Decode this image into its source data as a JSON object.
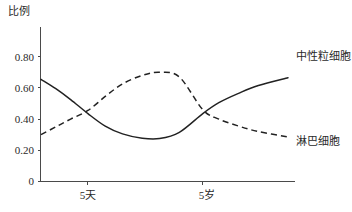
{
  "chart_data": {
    "type": "line",
    "title": "",
    "subtitle": "",
    "xlabel": "",
    "ylabel": "比例",
    "ylim": [
      0,
      0.99
    ],
    "ytick_labels": [
      "0.80",
      "0.60",
      "0.40",
      "0.20",
      "0"
    ],
    "ytick_values": [
      0.8,
      0.6,
      0.4,
      0.2,
      0
    ],
    "xtick_labels": [
      "5天",
      "5岁"
    ],
    "xtick_values": [
      0.19,
      0.655
    ],
    "xlim": [
      0,
      1
    ],
    "grid": false,
    "legend_position": "inline-right",
    "series": [
      {
        "name": "中性粒细胞",
        "style": "solid",
        "label_x": 0.99,
        "label_y": 0.675,
        "x": [
          0.0,
          0.06,
          0.12,
          0.19,
          0.26,
          0.33,
          0.41,
          0.48,
          0.56,
          0.655,
          0.72,
          0.8,
          0.88,
          1.0
        ],
        "values": [
          0.655,
          0.595,
          0.525,
          0.435,
          0.355,
          0.305,
          0.277,
          0.275,
          0.315,
          0.435,
          0.505,
          0.565,
          0.615,
          0.665
        ]
      },
      {
        "name": "淋巴细胞",
        "style": "dashed",
        "label_x": 0.99,
        "label_y": 0.225,
        "x": [
          0.0,
          0.06,
          0.12,
          0.19,
          0.26,
          0.33,
          0.41,
          0.48,
          0.56,
          0.655,
          0.72,
          0.8,
          0.88,
          1.0
        ],
        "values": [
          0.3,
          0.35,
          0.4,
          0.455,
          0.545,
          0.625,
          0.68,
          0.7,
          0.67,
          0.46,
          0.4,
          0.355,
          0.32,
          0.285
        ]
      }
    ],
    "annotations": []
  },
  "axis": {
    "y_title": "比例"
  },
  "series_labels": {
    "neutrophil": "中性粒细胞",
    "lymphocyte": "淋巴细胞"
  },
  "y_ticks": [
    {
      "label": "0.80"
    },
    {
      "label": "0.60"
    },
    {
      "label": "0.40"
    },
    {
      "label": "0.20"
    },
    {
      "label": "0"
    }
  ],
  "x_ticks": [
    {
      "label": "5天"
    },
    {
      "label": "5岁"
    }
  ],
  "colors": {
    "axis": "#4a4a4a",
    "curve": "#222222",
    "text": "#2a2a2a",
    "background": "#ffffff"
  }
}
